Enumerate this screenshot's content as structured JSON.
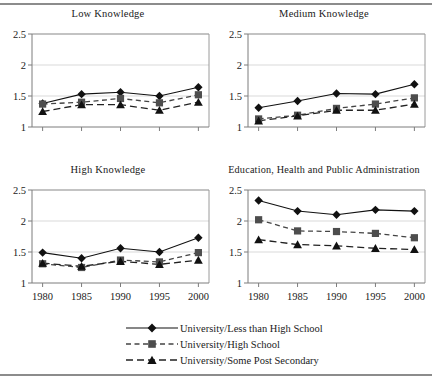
{
  "chart_data": [
    {
      "type": "line",
      "title": "Low Knowledge",
      "xlabel": "",
      "ylabel": "",
      "x": [
        1980,
        1985,
        1990,
        1995,
        2000
      ],
      "xtick_labels": [
        "1980",
        "1985",
        "1990",
        "1995",
        "2000"
      ],
      "ytick_labels": [
        "1",
        "1.5",
        "2",
        "2.5"
      ],
      "yticks": [
        1,
        1.5,
        2,
        2.5
      ],
      "ylim": [
        1,
        2.5
      ],
      "grid": true,
      "show_xticklabels": false,
      "series": [
        {
          "name": "University/Less than High School",
          "values": [
            1.38,
            1.53,
            1.56,
            1.5,
            1.64
          ]
        },
        {
          "name": "University/High School",
          "values": [
            1.37,
            1.4,
            1.46,
            1.39,
            1.52
          ]
        },
        {
          "name": "University/Some Post Secondary",
          "values": [
            1.25,
            1.36,
            1.36,
            1.27,
            1.4
          ]
        }
      ]
    },
    {
      "type": "line",
      "title": "Medium Knowledge",
      "xlabel": "",
      "ylabel": "",
      "x": [
        1980,
        1985,
        1990,
        1995,
        2000
      ],
      "xtick_labels": [
        "1980",
        "1985",
        "1990",
        "1995",
        "2000"
      ],
      "ytick_labels": [
        "1",
        "1.5",
        "2",
        "2.5"
      ],
      "yticks": [
        1,
        1.5,
        2,
        2.5
      ],
      "ylim": [
        1,
        2.5
      ],
      "grid": true,
      "show_xticklabels": false,
      "series": [
        {
          "name": "University/Less than High School",
          "values": [
            1.31,
            1.42,
            1.54,
            1.53,
            1.69
          ]
        },
        {
          "name": "University/High School",
          "values": [
            1.13,
            1.19,
            1.3,
            1.37,
            1.47
          ]
        },
        {
          "name": "University/Some Post Secondary",
          "values": [
            1.1,
            1.18,
            1.27,
            1.27,
            1.37
          ]
        }
      ]
    },
    {
      "type": "line",
      "title": "High Knowledge",
      "xlabel": "",
      "ylabel": "",
      "x": [
        1980,
        1985,
        1990,
        1995,
        2000
      ],
      "xtick_labels": [
        "1980",
        "1985",
        "1990",
        "1995",
        "2000"
      ],
      "ytick_labels": [
        "1",
        "1.5",
        "2",
        "2.5"
      ],
      "yticks": [
        1,
        1.5,
        2,
        2.5
      ],
      "ylim": [
        1,
        2.5
      ],
      "grid": true,
      "show_xticklabels": true,
      "series": [
        {
          "name": "University/Less than High School",
          "values": [
            1.49,
            1.4,
            1.56,
            1.5,
            1.73
          ]
        },
        {
          "name": "University/High School",
          "values": [
            1.31,
            1.25,
            1.37,
            1.34,
            1.49
          ]
        },
        {
          "name": "University/Some Post Secondary",
          "values": [
            1.32,
            1.27,
            1.35,
            1.3,
            1.37
          ]
        }
      ]
    },
    {
      "type": "line",
      "title": "Education, Health and Public Administration",
      "xlabel": "",
      "ylabel": "",
      "x": [
        1980,
        1985,
        1990,
        1995,
        2000
      ],
      "xtick_labels": [
        "1980",
        "1985",
        "1990",
        "1995",
        "2000"
      ],
      "ytick_labels": [
        "1",
        "1.5",
        "2",
        "2.5"
      ],
      "yticks": [
        1,
        1.5,
        2,
        2.5
      ],
      "ylim": [
        1,
        2.5
      ],
      "grid": true,
      "show_xticklabels": true,
      "series": [
        {
          "name": "University/Less than High School",
          "values": [
            2.33,
            2.16,
            2.1,
            2.18,
            2.16
          ]
        },
        {
          "name": "University/High School",
          "values": [
            2.02,
            1.84,
            1.83,
            1.8,
            1.73
          ]
        },
        {
          "name": "University/Some Post Secondary",
          "values": [
            1.7,
            1.62,
            1.6,
            1.56,
            1.54
          ]
        }
      ]
    }
  ],
  "legend": {
    "position": "bottom",
    "items": [
      {
        "label": "University/Less than High School",
        "marker": "diamond",
        "line": "solid"
      },
      {
        "label": "University/High School",
        "marker": "square",
        "line": "dashed-short"
      },
      {
        "label": "University/Some Post Secondary",
        "marker": "triangle",
        "line": "dashed-long"
      }
    ]
  }
}
